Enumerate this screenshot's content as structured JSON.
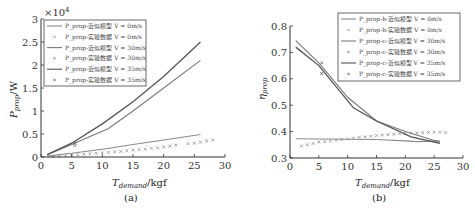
{
  "chart_data": [
    {
      "type": "line",
      "panel": "(a)",
      "xlabel": "T_demand/kgf",
      "ylabel": "P_prop/W",
      "y_multiplier": "×10^4",
      "xlim": [
        0,
        30
      ],
      "ylim": [
        0,
        3
      ],
      "xticks": [
        "0",
        "5",
        "10",
        "15",
        "20",
        "25",
        "30"
      ],
      "yticks": [
        "0",
        "0.5",
        "1",
        "1.5",
        "2",
        "2.5",
        "3"
      ],
      "grid": false,
      "legend_position": "upper left",
      "legend": [
        "P_prop-近似模型 V = 0m/s",
        "P_prop-实验数据 V = 0m/s",
        "P_prop-近似模型 V = 30m/s",
        "P_prop-实验数据 V = 30m/s",
        "P_prop-近似模型 V = 35m/s",
        "P_prop-实验数据 V = 35m/s"
      ],
      "series": [
        {
          "name": "P_prop-近似模型 V = 0m/s",
          "kind": "line",
          "color": "#8a8a8a",
          "x": [
            1,
            5,
            10,
            15,
            20,
            26
          ],
          "y": [
            0.02,
            0.08,
            0.17,
            0.27,
            0.37,
            0.49
          ]
        },
        {
          "name": "P_prop-实验数据 V = 0m/s",
          "kind": "marker",
          "color": "#9a9a9a",
          "x": [
            2,
            3,
            4,
            5,
            6,
            7,
            8,
            9,
            10,
            11,
            12,
            13,
            14,
            15,
            16,
            17,
            18,
            19,
            20,
            21,
            22,
            24,
            25,
            26,
            27,
            28
          ],
          "y": [
            0.01,
            0.02,
            0.03,
            0.04,
            0.05,
            0.06,
            0.07,
            0.08,
            0.09,
            0.1,
            0.11,
            0.12,
            0.14,
            0.15,
            0.16,
            0.17,
            0.19,
            0.2,
            0.22,
            0.24,
            0.26,
            0.29,
            0.3,
            0.32,
            0.35,
            0.37
          ]
        },
        {
          "name": "P_prop-近似模型 V = 30m/s",
          "kind": "line",
          "color": "#7a7a7a",
          "x": [
            1,
            5,
            11,
            15,
            20,
            26
          ],
          "y": [
            0.05,
            0.27,
            0.62,
            1.0,
            1.5,
            2.1
          ]
        },
        {
          "name": "P_prop-实验数据 V = 30m/s",
          "kind": "marker",
          "color": "#777777",
          "x": [
            5.5
          ],
          "y": [
            0.25
          ]
        },
        {
          "name": "P_prop-近似模型 V = 35m/s",
          "kind": "line",
          "color": "#555555",
          "x": [
            1,
            5,
            10,
            15,
            20,
            26
          ],
          "y": [
            0.05,
            0.3,
            0.72,
            1.2,
            1.75,
            2.5
          ]
        },
        {
          "name": "P_prop-实验数据 V = 35m/s",
          "kind": "marker",
          "color": "#555555",
          "x": [
            5.5
          ],
          "y": [
            0.3
          ]
        }
      ]
    },
    {
      "type": "line",
      "panel": "(b)",
      "xlabel": "T_demand/kgf",
      "ylabel": "η_prop",
      "xlim": [
        0,
        30
      ],
      "ylim": [
        0.3,
        0.8
      ],
      "xticks": [
        "0",
        "5",
        "10",
        "15",
        "20",
        "25",
        "30"
      ],
      "yticks": [
        "0.3",
        "0.4",
        "0.5",
        "0.6",
        "0.7",
        "0.8"
      ],
      "grid": false,
      "legend_position": "upper right",
      "legend": [
        "P_prop-h-近似模型 V = 0m/s",
        "P_prop-h-实验数据 V = 0m/s",
        "P_prop-c-近似模型 V = 30m/s",
        "P_prop-c-实验数据 V = 30m/s",
        "P_prop-c-近似模型 V = 35m/s",
        "P_prop-c-实验数据 V = 35m/s"
      ],
      "series": [
        {
          "name": "P_prop-h-近似模型 V = 0m/s",
          "kind": "line",
          "color": "#8a8a8a",
          "x": [
            1,
            5,
            10,
            15,
            20,
            22,
            26
          ],
          "y": [
            0.373,
            0.372,
            0.371,
            0.37,
            0.365,
            0.362,
            0.365
          ]
        },
        {
          "name": "P_prop-h-实验数据 V = 0m/s",
          "kind": "marker",
          "color": "#9a9a9a",
          "x": [
            2,
            3,
            4,
            5,
            6,
            7,
            8,
            9,
            10,
            11,
            12,
            13,
            14,
            15,
            16,
            17,
            18,
            19,
            20,
            21,
            22,
            23,
            24,
            25,
            26,
            27
          ],
          "y": [
            0.345,
            0.35,
            0.355,
            0.36,
            0.362,
            0.365,
            0.368,
            0.37,
            0.372,
            0.375,
            0.378,
            0.38,
            0.382,
            0.385,
            0.387,
            0.388,
            0.39,
            0.392,
            0.393,
            0.394,
            0.395,
            0.396,
            0.397,
            0.398,
            0.397,
            0.396
          ]
        },
        {
          "name": "P_prop-c-近似模型 V = 30m/s",
          "kind": "line",
          "color": "#7a7a7a",
          "x": [
            1,
            5,
            10,
            15,
            20,
            26
          ],
          "y": [
            0.745,
            0.66,
            0.53,
            0.44,
            0.4,
            0.36
          ]
        },
        {
          "name": "P_prop-c-实验数据 V = 30m/s",
          "kind": "marker",
          "color": "#777777",
          "x": [
            5.5
          ],
          "y": [
            0.66
          ]
        },
        {
          "name": "P_prop-c-近似模型 V = 35m/s",
          "kind": "line",
          "color": "#555555",
          "x": [
            1,
            5,
            11,
            15,
            21,
            26
          ],
          "y": [
            0.72,
            0.65,
            0.49,
            0.44,
            0.38,
            0.355
          ]
        },
        {
          "name": "P_prop-c-实验数据 V = 35m/s",
          "kind": "marker",
          "color": "#555555",
          "x": [
            5.5
          ],
          "y": [
            0.62
          ]
        }
      ]
    }
  ],
  "captions": {
    "a": "(a)",
    "b": "(b)"
  },
  "labels": {
    "a_ylabel_main": "P",
    "a_ylabel_sub": "prop",
    "a_ylabel_unit": "/W",
    "a_multiplier": "×10",
    "a_multiplier_exp": "4",
    "b_ylabel_main": "η",
    "b_ylabel_sub": "prop",
    "x_main": "T",
    "x_sub": "demand",
    "x_unit": "/kgf"
  }
}
